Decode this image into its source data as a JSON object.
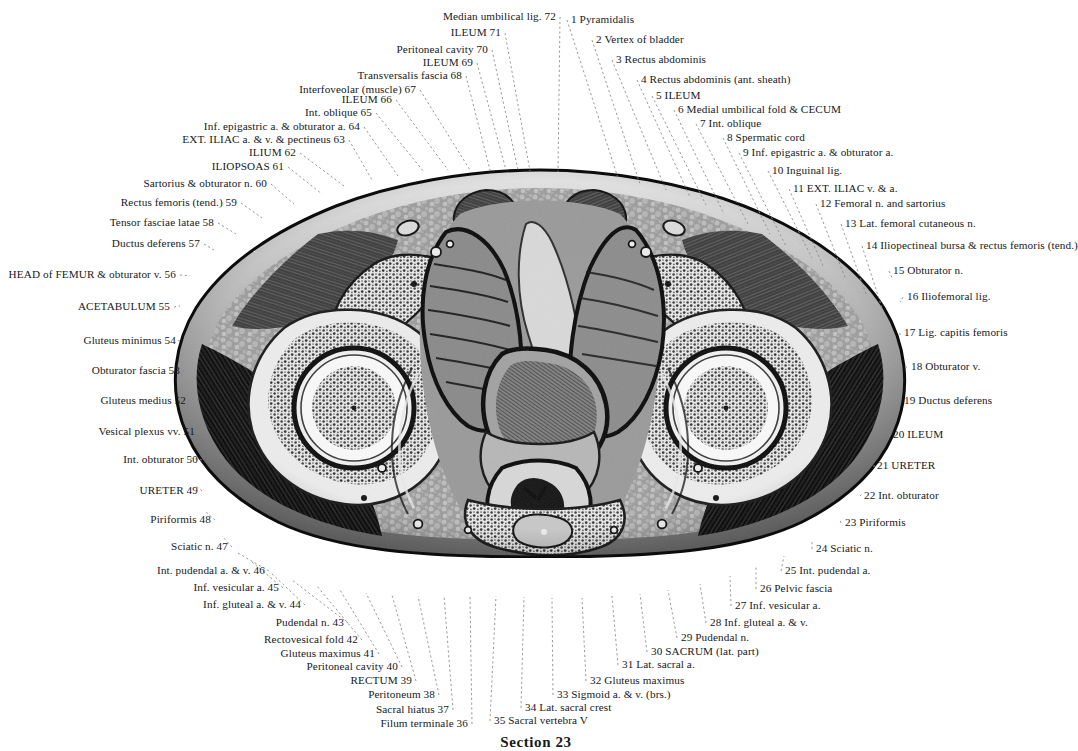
{
  "plate": {
    "caption": "Section 23",
    "title": "Transverse section of the male pelvis"
  },
  "colors": {
    "ink": "#16191d",
    "leader": "#8c8c8c",
    "paper": "#ffffff",
    "tissue_dark": "#1b1b1b",
    "tissue_mid": "#6f6f6f",
    "tissue_light": "#cfcfcf",
    "bone": "#efefef"
  },
  "labels_right": [
    {
      "n": "1",
      "text": "1 Pyramidalis",
      "x": 571,
      "y": 20,
      "tx": 618,
      "ty": 178
    },
    {
      "n": "2",
      "text": "2 Vertex of bladder",
      "x": 596,
      "y": 40,
      "tx": 640,
      "ty": 184
    },
    {
      "n": "3",
      "text": "3 Rectus abdominis",
      "x": 616,
      "y": 60,
      "tx": 666,
      "ty": 190
    },
    {
      "n": "4",
      "text": "4 Rectus abdominis (ant. sheath)",
      "x": 641,
      "y": 80,
      "tx": 690,
      "ty": 197
    },
    {
      "n": "5",
      "text": "5 ILEUM",
      "x": 656,
      "y": 96,
      "tx": 706,
      "ty": 205
    },
    {
      "n": "6",
      "text": "6 Medial umbilical fold & CECUM",
      "x": 678,
      "y": 110,
      "tx": 724,
      "ty": 214
    },
    {
      "n": "7",
      "text": "7 Int. oblique",
      "x": 700,
      "y": 124,
      "tx": 748,
      "ty": 224
    },
    {
      "n": "8",
      "text": "8 Spermatic cord",
      "x": 727,
      "y": 138,
      "tx": 770,
      "ty": 234
    },
    {
      "n": "9",
      "text": "9 Inf. epigastric a. & obturator a.",
      "x": 743,
      "y": 153,
      "tx": 786,
      "ty": 246
    },
    {
      "n": "10",
      "text": "10 Inguinal lig.",
      "x": 772,
      "y": 171,
      "tx": 812,
      "ty": 258
    },
    {
      "n": "11",
      "text": "11 EXT. ILIAC v. & a.",
      "x": 793,
      "y": 189,
      "tx": 824,
      "ty": 268
    },
    {
      "n": "12",
      "text": "12 Femoral n. and sartorius",
      "x": 820,
      "y": 204,
      "tx": 846,
      "ty": 280
    },
    {
      "n": "13",
      "text": "13 Lat. femoral cutaneous n.",
      "x": 845,
      "y": 224,
      "tx": 866,
      "ty": 294
    },
    {
      "n": "14",
      "text": "14 Iliopectineal bursa & rectus femoris (tend.)",
      "x": 866,
      "y": 246,
      "tx": 882,
      "ty": 308
    },
    {
      "n": "15",
      "text": "15 Obturator n.",
      "x": 893,
      "y": 271,
      "tx": 893,
      "ty": 280
    },
    {
      "n": "16",
      "text": "16 Iliofemoral lig.",
      "x": 907,
      "y": 297,
      "tx": 900,
      "ty": 302
    },
    {
      "n": "17",
      "text": "17 Lig. capitis femoris",
      "x": 904,
      "y": 333,
      "tx": 900,
      "ty": 335
    },
    {
      "n": "18",
      "text": "18 Obturator v.",
      "x": 911,
      "y": 367,
      "tx": 903,
      "ty": 368
    },
    {
      "n": "19",
      "text": "19 Ductus deferens",
      "x": 904,
      "y": 401,
      "tx": 899,
      "ty": 402
    },
    {
      "n": "20",
      "text": "20 ILEUM",
      "x": 893,
      "y": 435,
      "tx": 890,
      "ty": 436
    },
    {
      "n": "21",
      "text": "21 URETER",
      "x": 877,
      "y": 466,
      "tx": 876,
      "ty": 466
    },
    {
      "n": "22",
      "text": "22 Int. obturator",
      "x": 864,
      "y": 496,
      "tx": 862,
      "ty": 494
    },
    {
      "n": "23",
      "text": "23 Piriformis",
      "x": 845,
      "y": 523,
      "tx": 840,
      "ty": 519
    },
    {
      "n": "24",
      "text": "24 Sciatic n.",
      "x": 816,
      "y": 549,
      "tx": 812,
      "ty": 540
    },
    {
      "n": "25",
      "text": "25 Int. pudendal a.",
      "x": 785,
      "y": 571,
      "tx": 784,
      "ty": 556
    },
    {
      "n": "26",
      "text": "26 Pelvic fascia",
      "x": 760,
      "y": 589,
      "tx": 756,
      "ty": 567
    },
    {
      "n": "27",
      "text": "27 Inf. vesicular a.",
      "x": 735,
      "y": 606,
      "tx": 730,
      "ty": 576
    },
    {
      "n": "28",
      "text": "28 Inf. gluteal a. & v.",
      "x": 710,
      "y": 623,
      "tx": 700,
      "ty": 584
    },
    {
      "n": "29",
      "text": "29 Pudendal n.",
      "x": 681,
      "y": 638,
      "tx": 668,
      "ty": 590
    },
    {
      "n": "30",
      "text": "30 SACRUM (lat. part)",
      "x": 651,
      "y": 652,
      "tx": 640,
      "ty": 594
    },
    {
      "n": "31",
      "text": "31 Lat. sacral a.",
      "x": 622,
      "y": 665,
      "tx": 612,
      "ty": 596
    },
    {
      "n": "32",
      "text": "32 Gluteus maximus",
      "x": 590,
      "y": 681,
      "tx": 582,
      "ty": 598
    },
    {
      "n": "33",
      "text": "33 Sigmoid a. & v. (brs.)",
      "x": 557,
      "y": 695,
      "tx": 552,
      "ty": 598
    },
    {
      "n": "34",
      "text": "34 Lat. sacral crest",
      "x": 525,
      "y": 708,
      "tx": 524,
      "ty": 597
    },
    {
      "n": "35",
      "text": "35 Sacral vertebra V",
      "x": 494,
      "y": 721,
      "tx": 496,
      "ty": 596
    }
  ],
  "labels_left": [
    {
      "n": "36",
      "text": "Filum terminale 36",
      "x": 468,
      "y": 724,
      "tx": 470,
      "ty": 596
    },
    {
      "n": "37",
      "text": "Sacral hiatus 37",
      "x": 449,
      "y": 710,
      "tx": 444,
      "ty": 596
    },
    {
      "n": "38",
      "text": "Peritoneum 38",
      "x": 435,
      "y": 695,
      "tx": 418,
      "ty": 596
    },
    {
      "n": "39",
      "text": "RECTUM 39",
      "x": 412,
      "y": 681,
      "tx": 392,
      "ty": 595
    },
    {
      "n": "40",
      "text": "Peritoneal cavity 40",
      "x": 398,
      "y": 667,
      "tx": 366,
      "ty": 593
    },
    {
      "n": "41",
      "text": "Gluteus maximus 41",
      "x": 375,
      "y": 654,
      "tx": 340,
      "ty": 590
    },
    {
      "n": "42",
      "text": "Rectovesical fold 42",
      "x": 358,
      "y": 640,
      "tx": 316,
      "ty": 585
    },
    {
      "n": "43",
      "text": "Pudendal n. 43",
      "x": 344,
      "y": 623,
      "tx": 292,
      "ty": 580
    },
    {
      "n": "44",
      "text": "Inf. gluteal a. & v. 44",
      "x": 301,
      "y": 605,
      "tx": 270,
      "ty": 572
    },
    {
      "n": "45",
      "text": "Inf. vesicular a. 45",
      "x": 279,
      "y": 588,
      "tx": 252,
      "ty": 562
    },
    {
      "n": "46",
      "text": "Int. pudendal a. & v. 46",
      "x": 265,
      "y": 571,
      "tx": 236,
      "ty": 552
    },
    {
      "n": "47",
      "text": "Sciatic n. 47",
      "x": 228,
      "y": 547,
      "tx": 222,
      "ty": 536
    },
    {
      "n": "48",
      "text": "Piriformis 48",
      "x": 211,
      "y": 520,
      "tx": 206,
      "ty": 512
    },
    {
      "n": "49",
      "text": "URETER 49",
      "x": 198,
      "y": 491,
      "tx": 196,
      "ty": 486
    },
    {
      "n": "50",
      "text": "Int. obturator 50",
      "x": 198,
      "y": 460,
      "tx": 190,
      "ty": 458
    },
    {
      "n": "51",
      "text": "Vesical plexus vv. 51",
      "x": 195,
      "y": 432,
      "tx": 188,
      "ty": 430
    },
    {
      "n": "52",
      "text": "Gluteus medius 52",
      "x": 186,
      "y": 401,
      "tx": 182,
      "ty": 400
    },
    {
      "n": "53",
      "text": "Obturator fascia 53",
      "x": 180,
      "y": 371,
      "tx": 178,
      "ty": 370
    },
    {
      "n": "54",
      "text": "Gluteus minimus 54",
      "x": 176,
      "y": 341,
      "tx": 176,
      "ty": 340
    },
    {
      "n": "55",
      "text": "ACETABULUM 55",
      "x": 170,
      "y": 307,
      "tx": 180,
      "ty": 306
    },
    {
      "n": "56",
      "text": "HEAD of FEMUR & obturator v. 56",
      "x": 176,
      "y": 275,
      "tx": 190,
      "ty": 276
    },
    {
      "n": "57",
      "text": "Ductus deferens 57",
      "x": 200,
      "y": 244,
      "tx": 214,
      "ty": 250
    },
    {
      "n": "58",
      "text": "Tensor fasciae latae 58",
      "x": 214,
      "y": 223,
      "tx": 236,
      "ty": 234
    },
    {
      "n": "59",
      "text": "Rectus femoris (tend.) 59",
      "x": 237,
      "y": 203,
      "tx": 262,
      "ty": 218
    },
    {
      "n": "60",
      "text": "Sartorius & obturator n. 60",
      "x": 267,
      "y": 184,
      "tx": 294,
      "ty": 204
    },
    {
      "n": "61",
      "text": "ILIOPSOAS 61",
      "x": 284,
      "y": 167,
      "tx": 322,
      "ty": 194
    },
    {
      "n": "62",
      "text": "ILIUM 62",
      "x": 296,
      "y": 153,
      "tx": 344,
      "ty": 186
    },
    {
      "n": "63",
      "text": "EXT. ILIAC a. & v. & pectineus 63",
      "x": 345,
      "y": 140,
      "tx": 372,
      "ty": 180
    },
    {
      "n": "64",
      "text": "Inf. epigastric a. & obturator a. 64",
      "x": 360,
      "y": 127,
      "tx": 398,
      "ty": 176
    },
    {
      "n": "65",
      "text": "Int. oblique 65",
      "x": 372,
      "y": 113,
      "tx": 424,
      "ty": 172
    },
    {
      "n": "66",
      "text": "ILEUM 66",
      "x": 392,
      "y": 100,
      "tx": 448,
      "ty": 170
    },
    {
      "n": "67",
      "text": "Interfoveolar (muscle) 67",
      "x": 416,
      "y": 90,
      "tx": 470,
      "ty": 170
    },
    {
      "n": "68",
      "text": "Transversalis fascia 68",
      "x": 462,
      "y": 76,
      "tx": 490,
      "ty": 170
    },
    {
      "n": "69",
      "text": "ILEUM 69",
      "x": 473,
      "y": 63,
      "tx": 506,
      "ty": 170
    },
    {
      "n": "70",
      "text": "Peritoneal cavity 70",
      "x": 488,
      "y": 50,
      "tx": 518,
      "ty": 170
    },
    {
      "n": "71",
      "text": "ILEUM 71",
      "x": 501,
      "y": 33,
      "tx": 530,
      "ty": 171
    },
    {
      "n": "72",
      "text": "Median umbilical lig. 72",
      "x": 556,
      "y": 17,
      "tx": 558,
      "ty": 172
    }
  ]
}
